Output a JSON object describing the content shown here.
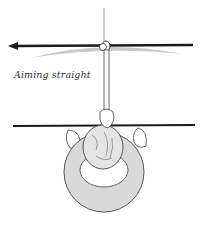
{
  "illustration": {
    "caption": "Aiming straight",
    "colors": {
      "line": "#1a1a1a",
      "shadow": "#b5b5b5",
      "shirt": "#d9d9d9",
      "outline": "#555555",
      "background": "#ffffff"
    }
  }
}
